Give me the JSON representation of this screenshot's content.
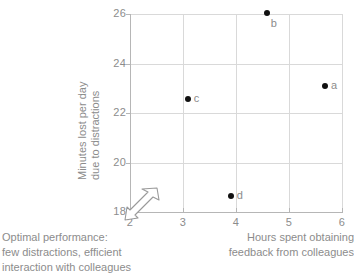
{
  "chart_data": {
    "type": "scatter",
    "title": "",
    "xlabel": "Hours spent obtaining feedback from colleagues",
    "ylabel": "Minutes lost per day due to distractions",
    "xlim": [
      2,
      6
    ],
    "ylim": [
      18,
      26
    ],
    "grid": true,
    "legend": "none",
    "x_ticks": [
      "2",
      "3",
      "4",
      "5",
      "6"
    ],
    "x_tick_values": [
      2,
      3,
      4,
      5,
      6
    ],
    "y_ticks": [
      "26",
      "24",
      "22",
      "20",
      "18"
    ],
    "y_tick_values": [
      26,
      24,
      22,
      20,
      18
    ],
    "points": [
      {
        "label": "a",
        "x": 5.68,
        "y": 23.1
      },
      {
        "label": "b",
        "x": 4.58,
        "y": 26.05
      },
      {
        "label": "c",
        "x": 3.09,
        "y": 22.55
      },
      {
        "label": "d",
        "x": 3.9,
        "y": 18.65
      }
    ],
    "annotations": [
      {
        "name": "optimal-performance-note",
        "lines": [
          "Optimal performance:",
          "few distractions, efficient",
          "interaction with colleagues"
        ],
        "arrow": "up-right-outline-arrow pointing toward origin"
      }
    ]
  },
  "axes": {
    "y_title_line1": "Minutes lost per day",
    "y_title_line2": "due to distractions",
    "x_title_line1": "Hours spent obtaining",
    "x_title_line2": "feedback from colleagues"
  },
  "annotation": {
    "line1": "Optimal performance:",
    "line2": "few distractions, efficient",
    "line3": "interaction with colleagues",
    "arrow_icon": "arrow-to-origin-icon"
  },
  "colors": {
    "point": "#111111",
    "grid": "#d9d9d9",
    "axis": "#b6b6b6",
    "text": "#8c8c8c",
    "background": "#ffffff"
  }
}
